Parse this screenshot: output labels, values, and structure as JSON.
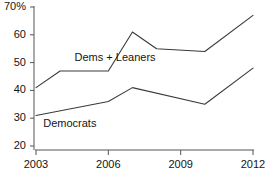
{
  "chart_data": {
    "type": "line",
    "title": "",
    "subtitle": "",
    "xlabel": "",
    "ylabel": "",
    "xlim": [
      2003,
      2012
    ],
    "ylim": [
      20,
      70
    ],
    "grid": false,
    "legend_position": "inline-annotation",
    "y_ticks": [
      20,
      30,
      40,
      50,
      60,
      70
    ],
    "y_tick_labels": [
      "20",
      "30",
      "40",
      "50",
      "60",
      "70%"
    ],
    "x_ticks": [
      2003,
      2006,
      2009,
      2012
    ],
    "x_tick_labels": [
      "2003",
      "2006",
      "2009",
      "2012"
    ],
    "line_color": "#3a3a3a",
    "axis_color": "#555555",
    "series": [
      {
        "name": "Dems + Leaners",
        "label_x": 2004.6,
        "label_y": 51.5,
        "x": [
          2003,
          2004,
          2006,
          2007,
          2008,
          2010,
          2012
        ],
        "values": [
          41,
          47,
          47,
          61,
          55,
          54,
          67
        ]
      },
      {
        "name": "Democrats",
        "label_x": 2003.3,
        "label_y": 28.0,
        "x": [
          2003,
          2006,
          2007,
          2010,
          2012
        ],
        "values": [
          31,
          36,
          41,
          35,
          48
        ]
      }
    ]
  }
}
